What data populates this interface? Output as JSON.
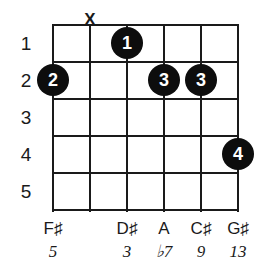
{
  "diagram": {
    "type": "guitar-chord-diagram",
    "strings_count": 6,
    "frets_count": 5,
    "colors": {
      "background": "#ffffff",
      "lines": "#1a1a1a",
      "dot_fill": "#0d0d0d",
      "dot_text": "#ffffff"
    },
    "geometry": {
      "grid_left": 52,
      "grid_right": 238,
      "grid_top": 24,
      "grid_bottom": 210,
      "string_spacing": 37,
      "fret_spacing": 37,
      "dot_diameter": 32
    }
  },
  "fret_numbers": [
    {
      "label": "1",
      "fret": 1
    },
    {
      "label": "2",
      "fret": 2
    },
    {
      "label": "3",
      "fret": 3
    },
    {
      "label": "4",
      "fret": 4
    },
    {
      "label": "5",
      "fret": 5
    }
  ],
  "markers": {
    "mute": [
      {
        "string": 2,
        "symbol": "X"
      }
    ]
  },
  "finger_dots": [
    {
      "label": "1",
      "string": 3,
      "fret": 1
    },
    {
      "label": "2",
      "string": 1,
      "fret": 2
    },
    {
      "label": "3",
      "string": 4,
      "fret": 2
    },
    {
      "label": "3",
      "string": 5,
      "fret": 2
    },
    {
      "label": "4",
      "string": 6,
      "fret": 4
    }
  ],
  "note_labels": [
    {
      "string": 1,
      "label": "F♯"
    },
    {
      "string": 2,
      "label": ""
    },
    {
      "string": 3,
      "label": "D♯"
    },
    {
      "string": 4,
      "label": "A"
    },
    {
      "string": 5,
      "label": "C♯"
    },
    {
      "string": 6,
      "label": "G♯"
    }
  ],
  "interval_labels": [
    {
      "string": 1,
      "label": "5"
    },
    {
      "string": 2,
      "label": ""
    },
    {
      "string": 3,
      "label": "3"
    },
    {
      "string": 4,
      "label": "♭7"
    },
    {
      "string": 5,
      "label": "9"
    },
    {
      "string": 6,
      "label": "13"
    }
  ]
}
